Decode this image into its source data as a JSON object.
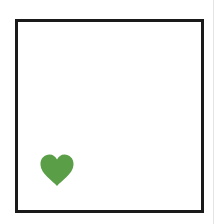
{
  "board": {
    "border_color": "#1a1a1a",
    "background": "#ffffff"
  },
  "items": [
    {
      "type": "heart",
      "icon": "heart-icon",
      "color": "#5a9e47"
    }
  ]
}
